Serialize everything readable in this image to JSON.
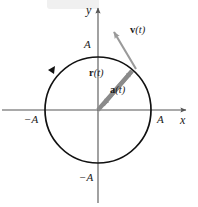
{
  "figure": {
    "background_color": "#ffffff",
    "axis_color": "#555555",
    "curve_color": "#111111",
    "vector_color": "#8a8a8a",
    "text_color": "#1a1a1a"
  },
  "axes": {
    "x_label": "x",
    "y_label": "y",
    "origin": {
      "x": 98,
      "y": 110
    }
  },
  "ticks": {
    "x_positive": "A",
    "x_negative": "−A",
    "y_positive": "A",
    "y_negative": "−A"
  },
  "circle": {
    "center_x": 98,
    "center_y": 110,
    "radius": 53,
    "direction": "counterclockwise"
  },
  "vectors": [
    {
      "id": "position",
      "symbol": "r",
      "arg": "(t)",
      "label_text": "r(t)",
      "from": {
        "x": 98,
        "y": 110
      },
      "to": {
        "x": 136,
        "y": 67
      },
      "description": "position vector from origin to particle on circle"
    },
    {
      "id": "acceleration",
      "symbol": "a",
      "arg": "(t)",
      "label_text": "a(t)",
      "from": {
        "x": 136,
        "y": 67
      },
      "to": {
        "x": 98,
        "y": 110
      },
      "description": "centripetal acceleration pointing toward center"
    },
    {
      "id": "velocity",
      "symbol": "v",
      "arg": "(t)",
      "label_text": "v(t)",
      "from": {
        "x": 135,
        "y": 68
      },
      "to": {
        "x": 110,
        "y": 27
      },
      "description": "velocity vector tangent to circle"
    }
  ],
  "labels": {
    "y_axis": "y",
    "x_axis": "x",
    "top_A": "A",
    "bottom_negA": "−A",
    "left_negA": "−A",
    "right_A": "A",
    "r_bold": "r",
    "r_arg": "(t)",
    "a_bold": "a",
    "a_arg": "(t)",
    "v_bold": "v",
    "v_arg": "(t)"
  }
}
